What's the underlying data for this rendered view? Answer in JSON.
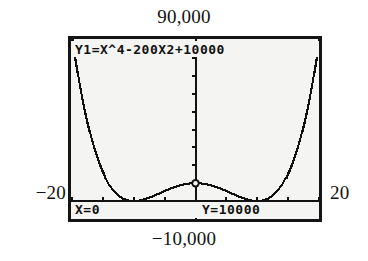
{
  "figure": {
    "kind": "graphing-calculator-screenshot",
    "device": "graphing calculator graph screen with TRACE cursor"
  },
  "annotations": {
    "ymax": "90,000",
    "ymin": "−10,000",
    "xmin": "−20",
    "xmax": "20"
  },
  "screen": {
    "equation": "Y1=X^4-200X",
    "equation_exponent": "2",
    "equation_tail": "+10000",
    "trace_x": "X=0",
    "trace_y": "Y=10000"
  },
  "colors": {
    "ink": "#111111",
    "screen_bg": "#f4f4f2",
    "bezel": "#141414",
    "page_bg": "#ffffff"
  },
  "chart_data": {
    "type": "line",
    "title": "",
    "subtitle": "",
    "xlabel": "",
    "ylabel": "",
    "expression": "y = x^4 - 200x^2 + 10000",
    "window": {
      "xmin": -20,
      "xmax": 20,
      "ymin": -10000,
      "ymax": 90000,
      "xscl": 5,
      "yscl": 10000
    },
    "xlim": [
      -20,
      20
    ],
    "ylim": [
      -10000,
      90000
    ],
    "grid": false,
    "legend": "none",
    "axes": {
      "x_axis_at_y": 0,
      "y_axis_at_x": 0,
      "x_ticks": [
        -20,
        -15,
        -10,
        -5,
        0,
        5,
        10,
        15,
        20
      ],
      "y_ticks": [
        0,
        10000,
        20000,
        30000,
        40000,
        50000,
        60000,
        70000,
        80000
      ]
    },
    "cursor": {
      "label": "trace-cursor",
      "x": 0,
      "y": 10000
    },
    "series": [
      {
        "name": "Y1",
        "x": [
          -20,
          -19,
          -18,
          -17,
          -16,
          -15,
          -14,
          -13,
          -12,
          -11,
          -10,
          -9,
          -8,
          -7,
          -6,
          -5,
          -4,
          -3,
          -2,
          -1,
          0,
          1,
          2,
          3,
          4,
          5,
          6,
          7,
          8,
          9,
          10,
          11,
          12,
          13,
          14,
          15,
          16,
          17,
          18,
          19,
          20
        ],
        "values": [
          90000,
          58321,
          39376,
          25521,
          14736,
          7525,
          3056,
          641,
          -464,
          -751,
          -500,
          39,
          1616,
          4299,
          6976,
          8125,
          6816,
          2809,
          -3184,
          -9199,
          10000,
          -9199,
          -3184,
          2809,
          6816,
          8125,
          6976,
          4299,
          1616,
          39,
          -500,
          -751,
          -464,
          641,
          3056,
          7525,
          14736,
          25521,
          39376,
          58321,
          90000
        ]
      }
    ]
  }
}
